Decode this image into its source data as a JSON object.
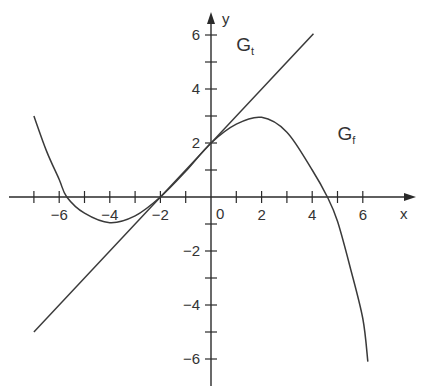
{
  "chart_data": {
    "type": "line",
    "title": "",
    "xlabel": "x",
    "ylabel": "y",
    "xlim": [
      -8,
      8
    ],
    "ylim": [
      -7,
      7
    ],
    "grid": false,
    "x_ticks": [
      -7,
      -6,
      -5,
      -4,
      -3,
      -2,
      -1,
      1,
      2,
      3,
      4,
      5,
      6
    ],
    "x_tick_labels": [
      {
        "value": -6,
        "label": "−6"
      },
      {
        "value": -4,
        "label": "−4"
      },
      {
        "value": -2,
        "label": "−2"
      },
      {
        "value": 0,
        "label": "0"
      },
      {
        "value": 2,
        "label": "2"
      },
      {
        "value": 4,
        "label": "4"
      },
      {
        "value": 6,
        "label": "6"
      }
    ],
    "y_ticks": [
      -6,
      -5,
      -4,
      -3,
      -2,
      -1,
      1,
      2,
      3,
      4,
      5,
      6
    ],
    "y_tick_labels": [
      {
        "value": 6,
        "label": "6"
      },
      {
        "value": 4,
        "label": "4"
      },
      {
        "value": 2,
        "label": "2"
      },
      {
        "value": -2,
        "label": "−2"
      },
      {
        "value": -4,
        "label": "−4"
      },
      {
        "value": -6,
        "label": "−6"
      }
    ],
    "series": [
      {
        "name": "G_f",
        "label_main": "G",
        "label_sub": "f",
        "label_pos": [
          5.0,
          2.1
        ],
        "x": [
          -7,
          -6.5,
          -6,
          -5.7,
          -5,
          -4,
          -3,
          -2,
          -1,
          0,
          1,
          2,
          3,
          4,
          4.6,
          5,
          5.5,
          6,
          6.2
        ],
        "y": [
          3.0,
          1.7,
          0.65,
          0,
          -0.6,
          -0.95,
          -0.7,
          0,
          0.95,
          2,
          2.7,
          2.95,
          2.4,
          1.0,
          0,
          -0.9,
          -2.6,
          -4.5,
          -6.1
        ]
      },
      {
        "name": "G_t",
        "label_main": "G",
        "label_sub": "t",
        "label_pos": [
          1.0,
          5.4
        ],
        "x": [
          -7,
          4.05
        ],
        "y": [
          -5,
          6.05
        ]
      }
    ]
  },
  "axes": {
    "x_label": "x",
    "y_label": "y",
    "origin_label": "0"
  }
}
